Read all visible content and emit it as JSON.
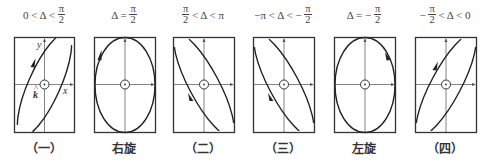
{
  "figure": {
    "stroke_color": "#222222",
    "axis_color": "#555555",
    "axis_labels": {
      "x": "x",
      "y": "y",
      "k": "k̂"
    },
    "panels": [
      {
        "id": "1",
        "condition": {
          "left": "0 < Δ <",
          "num": "π",
          "den": "2",
          "right": ""
        },
        "caption": "（一）",
        "box": {
          "x": 14,
          "w": 60
        },
        "tilt": "right",
        "arrow": "up-right"
      },
      {
        "id": "2",
        "condition": {
          "left": "Δ =",
          "num": "π",
          "den": "2",
          "right": ""
        },
        "caption": "右旋",
        "box": {
          "x": 94,
          "w": 61
        },
        "tilt": "none",
        "arrow": "up-left-side"
      },
      {
        "id": "3",
        "condition": {
          "left": "",
          "num": "π",
          "den": "2",
          "right": "< Δ < π"
        },
        "caption": "（二）",
        "box": {
          "x": 173,
          "w": 61
        },
        "tilt": "left",
        "arrow": "down-left-side"
      },
      {
        "id": "4",
        "condition": {
          "left": "−π < Δ < −",
          "num": "π",
          "den": "2",
          "right": ""
        },
        "caption": "（三）",
        "box": {
          "x": 253,
          "w": 61
        },
        "tilt": "left",
        "arrow": "down-left-side"
      },
      {
        "id": "5",
        "condition": {
          "left": "Δ = −",
          "num": "π",
          "den": "2",
          "right": ""
        },
        "caption": "左旋",
        "box": {
          "x": 334,
          "w": 61
        },
        "tilt": "none",
        "arrow": "down-right-side"
      },
      {
        "id": "6",
        "condition": {
          "left": "−",
          "num": "π",
          "den": "2",
          "right": "< Δ < 0"
        },
        "caption": "（四）",
        "box": {
          "x": 415,
          "w": 61
        },
        "tilt": "right",
        "arrow": "up-right"
      }
    ]
  }
}
